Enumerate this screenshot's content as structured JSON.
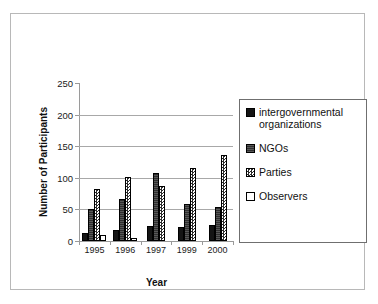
{
  "chart_data": {
    "type": "bar",
    "title": "",
    "xlabel": "Year",
    "ylabel": "Number of Participants",
    "categories": [
      "1995",
      "1996",
      "1997",
      "1999",
      "2000"
    ],
    "ylim": [
      0,
      250
    ],
    "yticks": [
      0,
      50,
      100,
      150,
      200,
      250
    ],
    "grid": true,
    "legend_position": "right",
    "series": [
      {
        "name": "intergovernmental organizations",
        "color": "#141414",
        "values": [
          13,
          18,
          24,
          22,
          25
        ]
      },
      {
        "name": "NGOs",
        "color": "#2e2e2e",
        "values": [
          50,
          67,
          107,
          58,
          54
        ]
      },
      {
        "name": "Parties",
        "color": "#2b2b2b",
        "values": [
          83,
          101,
          87,
          115,
          136
        ]
      },
      {
        "name": "Observers",
        "color": "#ffffff",
        "values": [
          10,
          5,
          0,
          0,
          0
        ]
      }
    ]
  },
  "legend": {
    "items": [
      {
        "label": "intergovernmental organizations",
        "swatch": "black-square-icon"
      },
      {
        "label": "NGOs",
        "swatch": "dark-gray-square-icon"
      },
      {
        "label": "Parties",
        "swatch": "checkered-square-icon"
      },
      {
        "label": "Observers",
        "swatch": "white-square-icon"
      }
    ]
  }
}
